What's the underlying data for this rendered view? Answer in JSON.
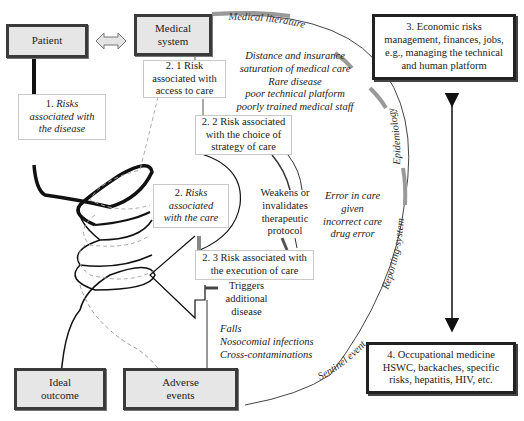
{
  "boxes": {
    "patient": "Patient",
    "medical_system_line1": "Medical",
    "medical_system_line2": "system",
    "ideal_outcome_line1": "Ideal",
    "ideal_outcome_line2": "outcome",
    "adverse_events_line1": "Adverse",
    "adverse_events_line2": "events",
    "economic": [
      "3. Economic risks",
      "management, finances, jobs,",
      "e.g., managing the technical",
      "and human platform"
    ],
    "occupational": [
      "4. Occupational medicine",
      "HSWC, backaches, specific",
      "risks, hepatitis, HIV, etc."
    ],
    "risk_disease": {
      "prefix": "1. ",
      "lines": [
        "Risks",
        "associated with",
        "the disease"
      ]
    },
    "risk_access": [
      "2. 1 Risk",
      "associated with",
      "access to care"
    ],
    "risk_strategy": [
      "2. 2 Risk associated",
      "with the choice of",
      "strategy of care"
    ],
    "risk_care": {
      "prefix": "2. ",
      "lines": [
        "Risks",
        "associated",
        "with the care"
      ]
    },
    "risk_execution": [
      "2. 3 Risk associated with",
      "the execution of care"
    ]
  },
  "annotations": {
    "access_factors": [
      "Distance and insurance",
      "saturation of medical care",
      "Rare disease",
      "poor technical platform",
      "poorly trained medical staff"
    ],
    "weakens": [
      "Weakens or",
      "invalidates",
      "therapeutic",
      "protocol"
    ],
    "error": [
      "Error in care",
      "given",
      "incorrect care",
      "drug error"
    ],
    "triggers": [
      "Triggers",
      "additional",
      "disease"
    ],
    "falls": [
      "Falls",
      "Nosocomial infections",
      "Cross-contaminations"
    ]
  },
  "arc_labels": {
    "medical_literature": "Medical literature",
    "epidemiology": "Epidemiology",
    "reporting_system": "Reporting-system",
    "sentinel_event": "Sentinel event"
  },
  "colors": {
    "box_fill": "#e6e6e6",
    "box_border": "#3a3a3a",
    "arc_highlight": "#9a9a9a",
    "line": "#111111",
    "light_border": "#c9c9c9"
  }
}
